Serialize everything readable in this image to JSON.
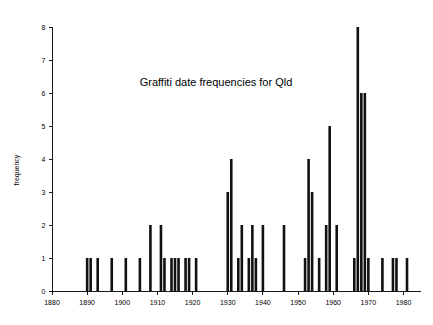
{
  "chart_data": {
    "type": "bar",
    "title": "Graffiti date frequencies for Qld",
    "xlabel": "",
    "ylabel": "frequency",
    "xlim": [
      1880,
      1985
    ],
    "ylim": [
      0,
      8
    ],
    "grid": false,
    "legend": false,
    "xticks": [
      1880,
      1890,
      1900,
      1910,
      1920,
      1930,
      1940,
      1950,
      1960,
      1970,
      1980
    ],
    "xtick_labels": [
      "1880",
      "1890",
      "1900",
      "1910",
      "1920",
      "1930",
      "1940",
      "1950",
      "1960",
      "1970",
      "1980"
    ],
    "yticks": [
      0,
      1,
      2,
      3,
      4,
      5,
      6,
      7,
      8
    ],
    "ytick_labels": [
      "0",
      "1",
      "2",
      "3",
      "4",
      "5",
      "6",
      "7",
      "8"
    ],
    "categories": [
      1890,
      1891,
      1893,
      1897,
      1901,
      1905,
      1908,
      1911,
      1912,
      1914,
      1915,
      1916,
      1918,
      1919,
      1921,
      1930,
      1931,
      1933,
      1934,
      1936,
      1937,
      1938,
      1940,
      1946,
      1952,
      1953,
      1954,
      1956,
      1958,
      1959,
      1961,
      1966,
      1967,
      1968,
      1969,
      1970,
      1974,
      1977,
      1978,
      1981
    ],
    "values": [
      1,
      1,
      1,
      1,
      1,
      1,
      2,
      2,
      1,
      1,
      1,
      1,
      1,
      1,
      1,
      3,
      4,
      1,
      2,
      1,
      2,
      1,
      2,
      2,
      1,
      4,
      3,
      1,
      2,
      5,
      2,
      1,
      8,
      6,
      6,
      1,
      1,
      1,
      1,
      1
    ]
  },
  "axes": {
    "y_axis_label": "frequency"
  }
}
